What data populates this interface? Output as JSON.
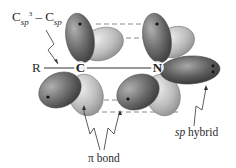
{
  "diagram": {
    "title_label": {
      "prefix": "C",
      "sub1": "sp",
      "sup1": "3",
      "dash": " – C",
      "sub2": "sp"
    },
    "substituent_label": "R",
    "atoms": {
      "carbon": "C",
      "nitrogen": "N"
    },
    "pi_bond_label": "π bond",
    "sp_hybrid_label": {
      "italic": "sp",
      "rest": " hybrid"
    },
    "colors": {
      "dark_lobe": "#6a6a6a",
      "light_lobe": "#b8b8b8",
      "sp_lobe": "#5e5e5e",
      "dashed_line": "#8a8a8a",
      "text": "#2a2a2a"
    }
  }
}
